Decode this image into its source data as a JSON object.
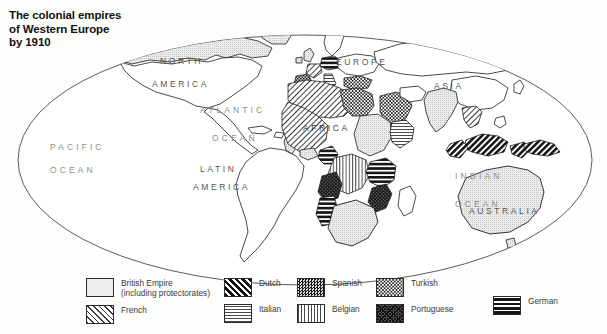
{
  "title": {
    "line1": "The colonial empires",
    "line2": "of Western Europe",
    "line3": "by 1910"
  },
  "map": {
    "projection": "oval world map",
    "ocean_labels": [
      {
        "id": "pacific",
        "text": "PACIFIC",
        "x": 50,
        "y": 150
      },
      {
        "id": "pacific-ocean",
        "text": "OCEAN",
        "x": 50,
        "y": 173
      },
      {
        "id": "atlantic",
        "text": "ATLANTIC",
        "x": 200,
        "y": 113
      },
      {
        "id": "atlantic-ocean",
        "text": "OCEAN",
        "x": 212,
        "y": 141
      },
      {
        "id": "indian",
        "text": "INDIAN",
        "x": 455,
        "y": 179
      },
      {
        "id": "indian-ocean",
        "text": "OCEAN",
        "x": 455,
        "y": 207
      }
    ],
    "continent_labels": [
      {
        "id": "north",
        "text": "NORTH",
        "x": 160,
        "y": 64
      },
      {
        "id": "north-america",
        "text": "AMERICA",
        "x": 152,
        "y": 87
      },
      {
        "id": "latin",
        "text": "LATIN",
        "x": 200,
        "y": 172
      },
      {
        "id": "latin-america",
        "text": "AMERICA",
        "x": 193,
        "y": 190
      },
      {
        "id": "europe",
        "text": "EUROPE",
        "x": 336,
        "y": 65
      },
      {
        "id": "asia",
        "text": "ASIA",
        "x": 434,
        "y": 89
      },
      {
        "id": "africa",
        "text": "AFRICA",
        "x": 303,
        "y": 131
      },
      {
        "id": "australia",
        "text": "AUSTRALIA",
        "x": 498,
        "y": 214
      }
    ]
  },
  "legend": {
    "columns": [
      {
        "id": "column-1",
        "items": [
          {
            "id": "british-empire",
            "pattern": "p-british",
            "label": "British Empire\n(including protectorates)",
            "label_line1": "British Empire",
            "label_line2": "(including protectorates)"
          },
          {
            "id": "french",
            "pattern": "p-french",
            "label_line1": "French",
            "label_line2": ""
          }
        ]
      },
      {
        "id": "column-2",
        "items": [
          {
            "id": "dutch",
            "pattern": "p-dutch",
            "label_line1": "Dutch",
            "label_line2": ""
          },
          {
            "id": "italian",
            "pattern": "p-italian",
            "label_line1": "Italian",
            "label_line2": ""
          }
        ]
      },
      {
        "id": "column-3",
        "items": [
          {
            "id": "spanish",
            "pattern": "p-spanish",
            "label_line1": "Spanish",
            "label_line2": ""
          },
          {
            "id": "belgian",
            "pattern": "p-belgian",
            "label_line1": "Belgian",
            "label_line2": ""
          }
        ]
      },
      {
        "id": "column-4",
        "items": [
          {
            "id": "turkish",
            "pattern": "p-turkish",
            "label_line1": "Turkish",
            "label_line2": ""
          },
          {
            "id": "portuguese",
            "pattern": "p-portuguese",
            "label_line1": "Portuguese",
            "label_line2": ""
          }
        ]
      },
      {
        "id": "column-5",
        "items": [
          {
            "id": "german",
            "pattern": "p-german",
            "label_line1": "German",
            "label_line2": ""
          }
        ]
      }
    ]
  },
  "colors": {
    "ink": "#1d1d1d",
    "ocean_text": "#8d8d8d",
    "land_text": "#555555",
    "paper": "#fdfdfb"
  }
}
